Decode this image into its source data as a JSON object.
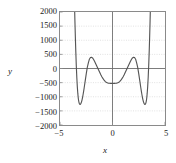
{
  "chart_data": {
    "type": "line",
    "title": "",
    "xlabel": "x",
    "ylabel": "y",
    "xlim": [
      -5,
      5
    ],
    "ylim": [
      -2000,
      2000
    ],
    "xticks": [
      -5,
      0,
      5
    ],
    "xtick_labels": [
      "−5",
      "0",
      "5"
    ],
    "yticks": [
      -2000,
      -1500,
      -1000,
      -500,
      0,
      500,
      1000,
      1500,
      2000
    ],
    "ytick_labels": [
      "−2000",
      "−1500",
      "−1000",
      "−500",
      "0",
      "500",
      "1000",
      "1500",
      "2000"
    ],
    "grid": true,
    "grid_style": "dotted",
    "legend": null,
    "series": [
      {
        "name": "f(x)",
        "color": "#555555",
        "x": [
          -3.62,
          -3.58,
          -3.54,
          -3.5,
          -3.45,
          -3.4,
          -3.35,
          -3.3,
          -3.25,
          -3.2,
          -3.15,
          -3.1,
          -3.05,
          -3.0,
          -2.95,
          -2.9,
          -2.85,
          -2.8,
          -2.75,
          -2.7,
          -2.6,
          -2.5,
          -2.4,
          -2.3,
          -2.2,
          -2.1,
          -2.0,
          -1.9,
          -1.8,
          -1.7,
          -1.6,
          -1.5,
          -1.4,
          -1.3,
          -1.2,
          -1.1,
          -1.0,
          -0.9,
          -0.8,
          -0.7,
          -0.6,
          -0.5,
          -0.4,
          -0.3,
          -0.2,
          -0.1,
          0.0,
          0.1,
          0.2,
          0.3,
          0.4,
          0.5,
          0.6,
          0.7,
          0.8,
          0.9,
          1.0,
          1.1,
          1.2,
          1.3,
          1.4,
          1.5,
          1.6,
          1.7,
          1.8,
          1.9,
          2.0,
          2.1,
          2.2,
          2.3,
          2.4,
          2.5,
          2.6,
          2.7,
          2.75,
          2.8,
          2.85,
          2.9,
          2.95,
          3.0,
          3.05,
          3.1,
          3.15,
          3.2,
          3.25,
          3.3,
          3.35,
          3.4,
          3.45,
          3.5,
          3.54,
          3.58,
          3.62
        ],
        "y": [
          2300,
          1700,
          1150,
          650,
          120,
          -310,
          -650,
          -900,
          -1080,
          -1190,
          -1250,
          -1270,
          -1262,
          -1230,
          -1180,
          -1110,
          -1020,
          -920,
          -810,
          -690,
          -440,
          -190,
          40,
          200,
          330,
          390,
          400,
          375,
          320,
          250,
          170,
          90,
          10,
          -70,
          -150,
          -230,
          -300,
          -360,
          -410,
          -455,
          -485,
          -505,
          -518,
          -523,
          -525,
          -525,
          -525,
          -525,
          -525,
          -523,
          -518,
          -505,
          -485,
          -455,
          -410,
          -360,
          -300,
          -230,
          -150,
          -70,
          10,
          90,
          170,
          250,
          320,
          375,
          400,
          390,
          330,
          200,
          40,
          -190,
          -440,
          -690,
          -810,
          -920,
          -1020,
          -1110,
          -1180,
          -1230,
          -1262,
          -1270,
          -1250,
          -1190,
          -1080,
          -900,
          -650,
          -310,
          120,
          650,
          1150,
          1700,
          2300
        ]
      }
    ],
    "annotations": {
      "central_minimum": {
        "x": 0,
        "y": -525
      },
      "local_maxima": [
        {
          "x": -2,
          "y": 400
        },
        {
          "x": 2,
          "y": 400
        }
      ],
      "deep_minima": [
        {
          "x": -3.1,
          "y": -1270
        },
        {
          "x": 3.1,
          "y": -1270
        }
      ]
    },
    "colors": {
      "curve": "#555555",
      "axis": "#6e6e6e",
      "frame": "#8a8a8a",
      "grid": "#cccccc",
      "text": "#1a1a1a",
      "background": "#ffffff"
    }
  }
}
